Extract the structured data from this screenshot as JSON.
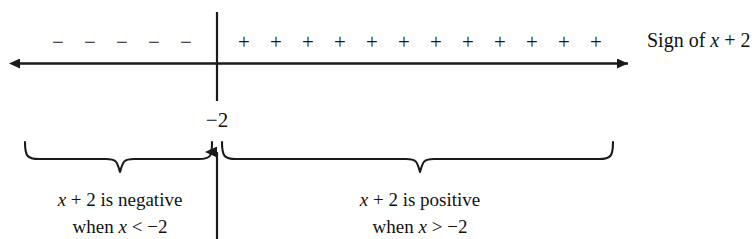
{
  "figure": {
    "ink_color": "#1a1a1a",
    "background": "#ffffff"
  },
  "number_line": {
    "axis_label": "Sign of x + 2",
    "axis_label_parts": {
      "prefix": "Sign of ",
      "variable": "x",
      "suffix": " + 2"
    },
    "critical_point_label": "−2",
    "left_arrowhead": "left-arrow-icon",
    "right_arrowhead": "right-arrow-icon",
    "divider": "vertical-divider"
  },
  "signs": {
    "negative_symbol": "−",
    "negative_count": 5,
    "negative_row": [
      "−",
      "−",
      "−",
      "−",
      "−"
    ],
    "positive_symbol": "+",
    "positive_count": 12,
    "positive_row": [
      "+",
      "+",
      "+",
      "+",
      "+",
      "+",
      "+",
      "+",
      "+",
      "+",
      "+",
      "+"
    ]
  },
  "braces": {
    "left": {
      "name": "left-brace",
      "caption_line1_prefix": "",
      "caption_line1_variable": "x",
      "caption_line1": "x + 2 is negative",
      "caption_line2": "when x < −2",
      "caption_line1_rest": " + 2 is negative",
      "caption_line2_prefix": "when ",
      "caption_line2_variable": "x",
      "caption_line2_rest": " < −2"
    },
    "right": {
      "name": "right-brace",
      "caption_line1": "x + 2 is positive",
      "caption_line2": "when x > −2",
      "caption_line1_variable": "x",
      "caption_line1_rest": " + 2 is positive",
      "caption_line2_prefix": "when ",
      "caption_line2_variable": "x",
      "caption_line2_rest": " > −2"
    }
  },
  "pointer": {
    "name": "up-arrow-to-critical-point",
    "points_to": "−2"
  }
}
